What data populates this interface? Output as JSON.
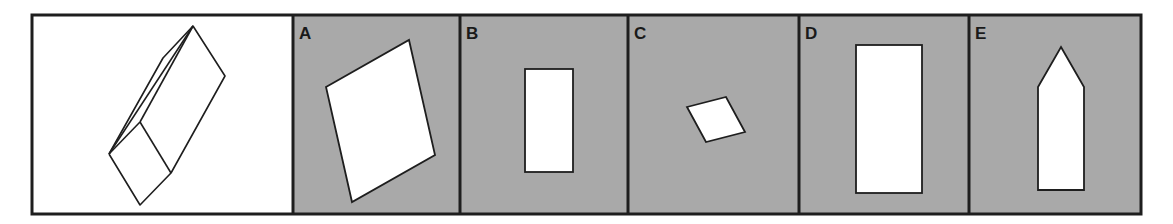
{
  "puzzle": {
    "colors": {
      "frame": "#1e1e1e",
      "panel_bg": "#a9a9a9",
      "reference_bg": "#ffffff",
      "shape_fill": "#ffffff",
      "shape_stroke": "#1e1e1e"
    },
    "reference": {
      "description": "Line drawing of a triangular prism viewed at an angle"
    },
    "options": [
      {
        "label": "A",
        "shape": "parallelogram (large, tilted)"
      },
      {
        "label": "B",
        "shape": "tall rectangle (small)"
      },
      {
        "label": "C",
        "shape": "parallelogram (small, tilted)"
      },
      {
        "label": "D",
        "shape": "tall rectangle (large)"
      },
      {
        "label": "E",
        "shape": "pentagon (pointed top)"
      }
    ]
  }
}
